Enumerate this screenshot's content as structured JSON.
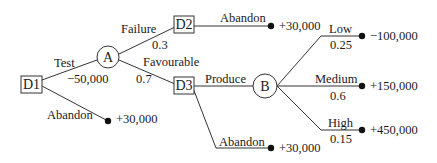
{
  "diagram": {
    "type": "decision-tree",
    "nodes": {
      "d1": {
        "label": "D1",
        "kind": "decision"
      },
      "a": {
        "label": "A",
        "kind": "chance"
      },
      "d2": {
        "label": "D2",
        "kind": "decision"
      },
      "d3": {
        "label": "D3",
        "kind": "decision"
      },
      "b": {
        "label": "B",
        "kind": "chance"
      }
    },
    "edges": {
      "test": {
        "label": "Test",
        "value": "−50,000"
      },
      "d1_abandon": {
        "label": "Abandon",
        "payoff": "+30,000"
      },
      "failure": {
        "label": "Failure",
        "prob": "0.3"
      },
      "favourable": {
        "label": "Favourable",
        "prob": "0.7"
      },
      "d2_abandon": {
        "label": "Abandon",
        "payoff": "+30,000"
      },
      "produce": {
        "label": "Produce"
      },
      "d3_abandon": {
        "label": "Abandon",
        "payoff": "+30,000"
      },
      "low": {
        "label": "Low",
        "prob": "0.25",
        "payoff": "−100,000"
      },
      "medium": {
        "label": "Medium",
        "prob": "0.6",
        "payoff": "+150,000"
      },
      "high": {
        "label": "High",
        "prob": "0.15",
        "payoff": "+450,000"
      }
    }
  }
}
